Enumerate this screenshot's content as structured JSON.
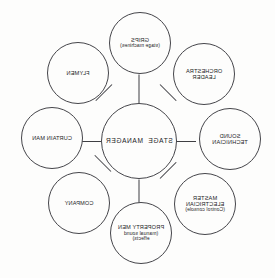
{
  "diagram": {
    "type": "hub-and-spoke organisation chart",
    "orientation": "mirrored-horizontally",
    "stroke_color": "#45454a",
    "background_color": "#fdfdfc",
    "text_color": "#1b1b1e",
    "center": {
      "id": "stage-manager",
      "label": "STAGE  MANAGER"
    },
    "nodes": [
      {
        "id": "grips",
        "label": "GRIPS",
        "sub": "(stage machines)",
        "position": "top"
      },
      {
        "id": "flymen",
        "label": "FLYMEN",
        "sub": "",
        "position": "top-right"
      },
      {
        "id": "curtain-man",
        "label": "CURTAIN MAN",
        "sub": "",
        "position": "right"
      },
      {
        "id": "company",
        "label": "COMPANY",
        "sub": "",
        "position": "bottom-right"
      },
      {
        "id": "property-men",
        "label": "PROPERTY MEN",
        "sub": "(manual sound",
        "sub2": "effects)",
        "position": "bottom"
      },
      {
        "id": "master-electrician",
        "label_line1": "MASTER",
        "label_line2": "ELECTRICIAN",
        "sub": "(Control console)",
        "position": "bottom-left"
      },
      {
        "id": "sound-technician",
        "label_line1": "SOUND",
        "label_line2": "TECHNICIAN",
        "sub": "",
        "position": "left"
      },
      {
        "id": "orchestra-leader",
        "label_line1": "ORCHESTRA",
        "label_line2": "LEADER",
        "sub": "",
        "position": "top-left"
      }
    ],
    "connector_count": 8
  }
}
